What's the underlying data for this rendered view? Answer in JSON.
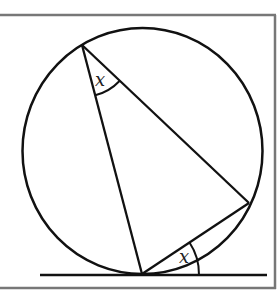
{
  "diagram": {
    "labels": {
      "top_angle": "x",
      "tangent_angle": "x"
    },
    "colors": {
      "stroke": "#111111",
      "frame": "#777777",
      "background": "#ffffff"
    },
    "circle": {
      "cx": 142.5,
      "cy": 151,
      "rx": 120,
      "ry": 123
    },
    "points": {
      "top": [
        82,
        45
      ],
      "right": [
        249,
        203
      ],
      "tangent": [
        142,
        274
      ]
    },
    "tangent_line": {
      "x1": 40,
      "x2": 267,
      "y": 275
    }
  }
}
